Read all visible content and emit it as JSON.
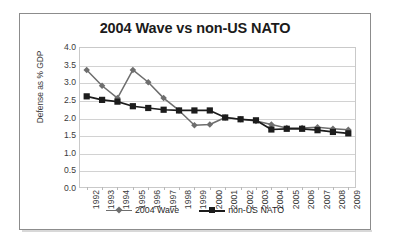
{
  "chart_data": {
    "type": "line",
    "title": "2004 Wave vs non-US NATO",
    "xlabel": "",
    "ylabel": "Defense as % GDP",
    "ylim": [
      0.0,
      4.0
    ],
    "yticks": [
      "0.0",
      "0.5",
      "1.0",
      "1.5",
      "2.0",
      "2.5",
      "3.0",
      "3.5",
      "4.0"
    ],
    "ytick_values": [
      0.0,
      0.5,
      1.0,
      1.5,
      2.0,
      2.5,
      3.0,
      3.5,
      4.0
    ],
    "grid": "horizontal",
    "legend_position": "bottom",
    "categories": [
      "1992",
      "1993",
      "1994",
      "1995",
      "1996",
      "1997",
      "1998",
      "1999",
      "2000",
      "2001",
      "2002",
      "2003",
      "2004",
      "2005",
      "2006",
      "2007",
      "2008",
      "2009"
    ],
    "series": [
      {
        "name": "2004 Wave",
        "color": "#6e6e6e",
        "marker": "diamond",
        "values": [
          3.35,
          2.9,
          2.55,
          3.35,
          3.0,
          2.55,
          2.2,
          1.78,
          1.8,
          2.0,
          1.95,
          1.9,
          1.8,
          1.7,
          1.7,
          1.72,
          1.68,
          1.65
        ]
      },
      {
        "name": "non-US NATO",
        "color": "#1c1c1c",
        "marker": "square",
        "values": [
          2.6,
          2.5,
          2.45,
          2.32,
          2.27,
          2.22,
          2.2,
          2.2,
          2.2,
          2.0,
          1.95,
          1.92,
          1.66,
          1.68,
          1.68,
          1.64,
          1.59,
          1.55
        ]
      }
    ]
  },
  "legend": {
    "entries": [
      {
        "label": "2004 Wave"
      },
      {
        "label": "non-US NATO"
      }
    ]
  }
}
